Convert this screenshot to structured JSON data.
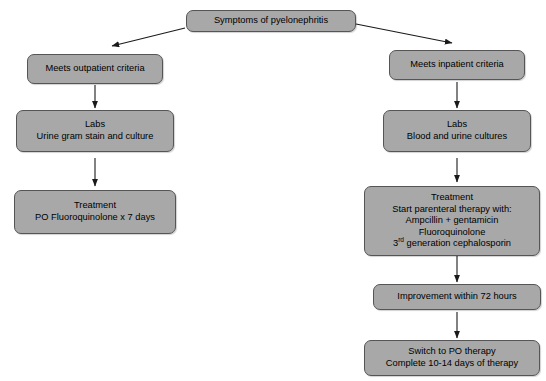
{
  "diagram": {
    "style": {
      "node_fill": "#a8a8a8",
      "node_border": "#555555",
      "edge_color": "#1a1a1a",
      "background": "#ffffff",
      "text_color": "#000000"
    },
    "nodes": {
      "root": {
        "id": "symptoms",
        "lines": [
          "Symptoms of pyelonephritis"
        ]
      },
      "outpatient_criteria": {
        "id": "meets-outpatient-criteria",
        "lines": [
          "Meets outpatient criteria"
        ]
      },
      "outpatient_labs": {
        "id": "outpatient-labs",
        "lines": [
          "Labs",
          "Urine gram stain and culture"
        ]
      },
      "outpatient_treatment": {
        "id": "outpatient-treatment",
        "lines": [
          "Treatment",
          "PO Fluoroquinolone x 7 days"
        ]
      },
      "inpatient_criteria": {
        "id": "meets-inpatient-criteria",
        "lines": [
          "Meets inpatient criteria"
        ]
      },
      "inpatient_labs": {
        "id": "inpatient-labs",
        "lines": [
          "Labs",
          "Blood and urine cultures"
        ]
      },
      "inpatient_treatment": {
        "id": "inpatient-treatment",
        "lines": [
          "Treatment",
          "Start parenteral therapy with:",
          "Ampcillin + gentamicin",
          "Fluoroquinolone"
        ],
        "last_line_prefix": "3",
        "last_line_superscript": "rd",
        "last_line_suffix": " generation cephalosporin"
      },
      "improvement": {
        "id": "improvement-within-72-hours",
        "lines": [
          "Improvement within 72 hours"
        ]
      },
      "switch_po": {
        "id": "switch-to-po-therapy",
        "lines": [
          "Switch to PO therapy",
          "Complete 10-14 days of therapy"
        ]
      }
    },
    "edges": [
      {
        "from": "symptoms",
        "to": "meets-outpatient-criteria",
        "kind": "diagonal-left"
      },
      {
        "from": "symptoms",
        "to": "meets-inpatient-criteria",
        "kind": "diagonal-right"
      },
      {
        "from": "meets-outpatient-criteria",
        "to": "outpatient-labs",
        "kind": "vertical"
      },
      {
        "from": "outpatient-labs",
        "to": "outpatient-treatment",
        "kind": "vertical"
      },
      {
        "from": "meets-inpatient-criteria",
        "to": "inpatient-labs",
        "kind": "vertical"
      },
      {
        "from": "inpatient-labs",
        "to": "inpatient-treatment",
        "kind": "vertical"
      },
      {
        "from": "inpatient-treatment",
        "to": "improvement-within-72-hours",
        "kind": "vertical"
      },
      {
        "from": "improvement-within-72-hours",
        "to": "switch-to-po-therapy",
        "kind": "vertical"
      }
    ]
  }
}
